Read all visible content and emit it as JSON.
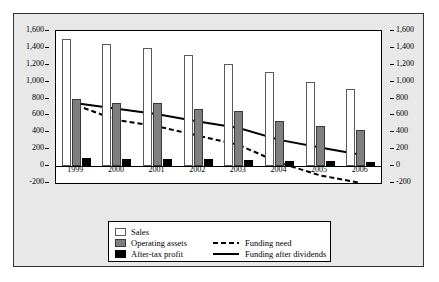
{
  "chart_data": {
    "type": "bar",
    "title": "",
    "subtitle": "",
    "xlabel": "",
    "ylabel": "",
    "ylim": [
      -200,
      1600
    ],
    "y_ticks": [
      1600,
      1400,
      1200,
      1000,
      800,
      600,
      400,
      200,
      0,
      -200
    ],
    "y_tick_labels": [
      "1,600",
      "1,400",
      "1,200",
      "1,000",
      "800",
      "600",
      "400",
      "200",
      "0",
      "-200"
    ],
    "dual_axis": true,
    "right_axis_ticks": [
      1600,
      1400,
      1200,
      1000,
      800,
      600,
      400,
      200,
      0,
      -200
    ],
    "right_axis_tick_labels": [
      "1,600",
      "1,400",
      "1,200",
      "1,000",
      "800",
      "600",
      "400",
      "200",
      "0",
      "-200"
    ],
    "grid": false,
    "legend_position": "bottom",
    "categories": [
      "1999",
      "2000",
      "2001",
      "2002",
      "2003",
      "2004",
      "2005",
      "2006"
    ],
    "series": [
      {
        "name": "Sales",
        "kind": "bar",
        "color": "#ffffff",
        "values": [
          1500,
          1450,
          1400,
          1310,
          1210,
          1110,
          1000,
          910
        ]
      },
      {
        "name": "Operating assets",
        "kind": "bar",
        "color": "#7f7f7f",
        "values": [
          800,
          750,
          750,
          680,
          655,
          535,
          480,
          430
        ]
      },
      {
        "name": "After-tax profit",
        "kind": "bar",
        "color": "#000000",
        "values": [
          100,
          90,
          90,
          80,
          75,
          65,
          60,
          50
        ]
      },
      {
        "name": "Funding need",
        "kind": "line",
        "style": "dashed",
        "color": "#000000",
        "values": [
          720,
          545,
          470,
          360,
          250,
          40,
          -110,
          -200
        ]
      },
      {
        "name": "Funding after dividends",
        "kind": "line",
        "style": "solid",
        "color": "#000000",
        "values": [
          745,
          680,
          615,
          530,
          450,
          310,
          220,
          135
        ]
      }
    ]
  },
  "legend": {
    "items": [
      {
        "label": "Sales",
        "swatch": "sales"
      },
      {
        "label": "Operating assets",
        "swatch": "assets"
      },
      {
        "label": "After-tax profit",
        "swatch": "profit"
      },
      {
        "label": "Funding need",
        "swatch": "dashed-line"
      },
      {
        "label": "Funding after dividends",
        "swatch": "solid-line"
      }
    ]
  }
}
